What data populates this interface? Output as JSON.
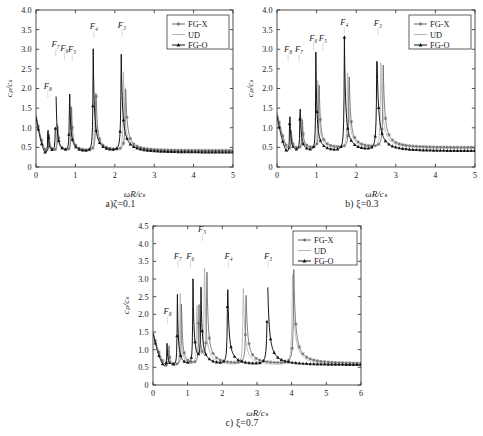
{
  "figure": {
    "background": "#ffffff",
    "axis_color": "#3a3a3a",
    "text_color": "#1a1a1a"
  },
  "series_styles": {
    "FG-X": {
      "color": "#6b6b6b",
      "marker": "asterisk"
    },
    "UD": {
      "color": "#b4b4b4",
      "marker": "none"
    },
    "FG-O": {
      "color": "#141414",
      "marker": "triangle"
    }
  },
  "legend": {
    "entries": [
      "FG-X",
      "UD",
      "FG-O"
    ],
    "position": "top-right"
  },
  "axis_titles": {
    "x": "ωR/cₛ",
    "y": "cₚ/cₛ"
  },
  "chart_data": [
    {
      "id": "a",
      "type": "line",
      "title": "",
      "caption": "a)ζ=0.1",
      "xlabel": "ωR/cₛ",
      "ylabel": "cₚ/cₛ",
      "xlim": [
        0,
        5
      ],
      "ylim": [
        0,
        4.0
      ],
      "xticks": [
        0,
        1,
        2,
        3,
        4,
        5
      ],
      "yticks": [
        0,
        0.5,
        1.0,
        1.5,
        2.0,
        2.5,
        3.0,
        3.5,
        4.0
      ],
      "xticklabels": [
        "0",
        "1",
        "2",
        "3",
        "4",
        "5"
      ],
      "yticklabels": [
        "0",
        "0.5",
        "1.0",
        "1.5",
        "2.0",
        "2.5",
        "3.0",
        "3.5",
        "4.0"
      ],
      "grid": false,
      "legend": [
        "FG-X",
        "UD",
        "FG-O"
      ],
      "annotations": [
        {
          "label": "F₈",
          "x": 0.3,
          "y": 2.0
        },
        {
          "label": "F₇",
          "x": 0.5,
          "y": 3.05
        },
        {
          "label": "F₆",
          "x": 0.72,
          "y": 2.95
        },
        {
          "label": "F₅",
          "x": 0.92,
          "y": 2.92
        },
        {
          "label": "F₄",
          "x": 1.47,
          "y": 3.52
        },
        {
          "label": "F₃",
          "x": 2.18,
          "y": 3.55
        }
      ],
      "resonances": {
        "FG-O": [
          0.3,
          0.5,
          0.85,
          1.45,
          2.16
        ],
        "UD": [
          0.32,
          0.53,
          0.88,
          1.49,
          2.22
        ],
        "FG-X": [
          0.33,
          0.55,
          0.9,
          1.52,
          2.27
        ]
      },
      "peak_heights": {
        "FG-O": [
          1.22,
          2.58,
          2.22,
          3.16,
          3.08
        ],
        "UD": [
          1.05,
          1.38,
          1.78,
          2.35,
          2.45
        ],
        "FG-X": [
          1.0,
          1.3,
          1.7,
          2.25,
          2.35
        ]
      },
      "baseline": {
        "FG-O": 0.33,
        "UD": 0.36,
        "FG-X": 0.38
      }
    },
    {
      "id": "b",
      "type": "line",
      "title": "",
      "caption": "b) ξ=0.3",
      "xlabel": "ωR/cₛ",
      "ylabel": "cₚ/cₛ",
      "xlim": [
        0,
        5
      ],
      "ylim": [
        0,
        4.0
      ],
      "xticks": [
        0,
        1,
        2,
        3,
        4,
        5
      ],
      "yticks": [
        0,
        0.5,
        1.0,
        1.5,
        2.0,
        2.5,
        3.0,
        3.5,
        4.0
      ],
      "xticklabels": [
        "0",
        "1",
        "2",
        "3",
        "4",
        "5"
      ],
      "yticklabels": [
        "0",
        "0.5",
        "1.0",
        "1.5",
        "2.0",
        "2.5",
        "3.0",
        "3.5",
        "4.0"
      ],
      "grid": false,
      "legend": [
        "FG-X",
        "UD",
        "FG-O"
      ],
      "annotations": [
        {
          "label": "F₈",
          "x": 0.28,
          "y": 2.92
        },
        {
          "label": "F₇",
          "x": 0.56,
          "y": 2.92
        },
        {
          "label": "F₆",
          "x": 0.92,
          "y": 3.22
        },
        {
          "label": "F₅",
          "x": 1.16,
          "y": 3.2
        },
        {
          "label": "F₄",
          "x": 1.7,
          "y": 3.62
        },
        {
          "label": "F₃",
          "x": 2.55,
          "y": 3.6
        }
      ],
      "resonances": {
        "FG-O": [
          0.32,
          0.58,
          0.98,
          1.7,
          2.52
        ],
        "UD": [
          0.35,
          0.62,
          1.03,
          1.78,
          2.62
        ],
        "FG-X": [
          0.36,
          0.64,
          1.06,
          1.82,
          2.68
        ]
      },
      "peak_heights": {
        "FG-O": [
          1.68,
          1.83,
          2.97,
          3.46,
          3.2
        ],
        "UD": [
          1.15,
          1.45,
          2.8,
          2.95,
          2.9
        ],
        "FG-X": [
          1.05,
          1.35,
          2.6,
          2.7,
          2.7
        ]
      },
      "baseline": {
        "FG-O": 0.36,
        "UD": 0.42,
        "FG-X": 0.45
      }
    },
    {
      "id": "c",
      "type": "line",
      "title": "",
      "caption": "c) ξ=0.7",
      "xlabel": "ωR/cₛ",
      "ylabel": "cₚ/cₛ",
      "xlim": [
        0,
        6
      ],
      "ylim": [
        0,
        4.5
      ],
      "xticks": [
        0,
        1,
        2,
        3,
        4,
        5,
        6
      ],
      "yticks": [
        0,
        0.5,
        1.0,
        1.5,
        2.0,
        2.5,
        3.0,
        3.5,
        4.0,
        4.5
      ],
      "xticklabels": [
        "0",
        "1",
        "2",
        "3",
        "4",
        "5",
        "6"
      ],
      "yticklabels": [
        "0",
        "0.5",
        "1.0",
        "1.5",
        "2.0",
        "2.5",
        "3.0",
        "3.5",
        "4.0",
        "4.5"
      ],
      "grid": false,
      "legend": [
        "FG-X",
        "UD",
        "FG-O"
      ],
      "annotations": [
        {
          "label": "F₈",
          "x": 0.42,
          "y": 2.0
        },
        {
          "label": "F₇",
          "x": 0.72,
          "y": 3.58
        },
        {
          "label": "F₆",
          "x": 1.08,
          "y": 3.58
        },
        {
          "label": "F₅",
          "x": 1.42,
          "y": 4.32
        },
        {
          "label": "F₄",
          "x": 2.18,
          "y": 3.58
        },
        {
          "label": "F₃",
          "x": 3.32,
          "y": 3.58
        }
      ],
      "resonances": {
        "FG-O": [
          0.4,
          0.7,
          1.15,
          1.38,
          2.15,
          3.3
        ],
        "UD": [
          0.44,
          0.78,
          1.26,
          1.48,
          2.6,
          4.02
        ],
        "FG-X": [
          0.46,
          0.82,
          1.32,
          1.55,
          2.68,
          4.06
        ]
      },
      "peak_heights": {
        "FG-O": [
          1.32,
          2.94,
          3.35,
          2.98,
          3.16,
          3.34
        ],
        "UD": [
          1.22,
          3.05,
          2.85,
          4.05,
          3.16,
          3.46
        ],
        "FG-X": [
          1.15,
          2.8,
          2.7,
          3.8,
          2.95,
          3.3
        ]
      },
      "baseline": {
        "FG-O": 0.52,
        "UD": 0.5,
        "FG-X": 0.55
      }
    }
  ]
}
